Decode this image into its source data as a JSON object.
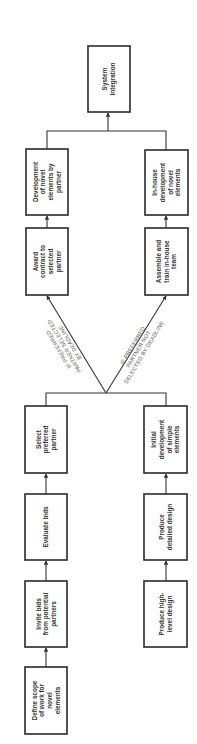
{
  "diagram": {
    "type": "flowchart",
    "orientation": "rotated-90-counterclockwise",
    "nodes": [
      {
        "id": "define-scope",
        "lines": [
          "Define scope",
          "of work for",
          "novel",
          "elements"
        ]
      },
      {
        "id": "invite-bids",
        "lines": [
          "Invite bids",
          "from potential",
          "partners"
        ]
      },
      {
        "id": "evaluate-bids",
        "lines": [
          "Evaluate bids"
        ]
      },
      {
        "id": "select-partner",
        "lines": [
          "Select",
          "preferred",
          "partner"
        ]
      },
      {
        "id": "award-contract",
        "lines": [
          "Award",
          "contract to",
          "selected",
          "partner"
        ]
      },
      {
        "id": "dev-by-partner",
        "lines": [
          "Development",
          "of novel",
          "elements by",
          "partner"
        ]
      },
      {
        "id": "high-level-design",
        "lines": [
          "Produce high-",
          "level design"
        ]
      },
      {
        "id": "detailed-design",
        "lines": [
          "Produce",
          "detailed design"
        ]
      },
      {
        "id": "initial-dev",
        "lines": [
          "Initial",
          "development",
          "of simple",
          "elements"
        ]
      },
      {
        "id": "assemble-team",
        "lines": [
          "Assemble and",
          "train in-house",
          "team"
        ]
      },
      {
        "id": "inhouse-dev",
        "lines": [
          "In-house",
          "development",
          "of novel",
          "elements"
        ]
      },
      {
        "id": "system-integration",
        "lines": [
          "System",
          "Integration"
        ]
      }
    ],
    "conditions": [
      {
        "id": "cond-selected",
        "lines": [
          "IF PREFERRED",
          "PARTNER SELECTED",
          "BY DEADLINE"
        ]
      },
      {
        "id": "cond-not-selected",
        "lines": [
          "IF PREFERRED",
          "PARTNER NOT",
          "SELECTED BY DEADLINE"
        ]
      }
    ],
    "edges": [
      {
        "from": "define-scope",
        "to": "invite-bids"
      },
      {
        "from": "invite-bids",
        "to": "evaluate-bids"
      },
      {
        "from": "evaluate-bids",
        "to": "select-partner"
      },
      {
        "from": "high-level-design",
        "to": "detailed-design"
      },
      {
        "from": "detailed-design",
        "to": "initial-dev"
      },
      {
        "from": "select-partner",
        "to": "award-contract",
        "condition": "cond-selected"
      },
      {
        "from": "initial-dev",
        "to": "award-contract",
        "condition": "cond-selected"
      },
      {
        "from": "select-partner",
        "to": "assemble-team",
        "condition": "cond-not-selected"
      },
      {
        "from": "initial-dev",
        "to": "assemble-team",
        "condition": "cond-not-selected"
      },
      {
        "from": "award-contract",
        "to": "dev-by-partner"
      },
      {
        "from": "assemble-team",
        "to": "inhouse-dev"
      },
      {
        "from": "dev-by-partner",
        "to": "system-integration"
      },
      {
        "from": "inhouse-dev",
        "to": "system-integration"
      }
    ]
  }
}
